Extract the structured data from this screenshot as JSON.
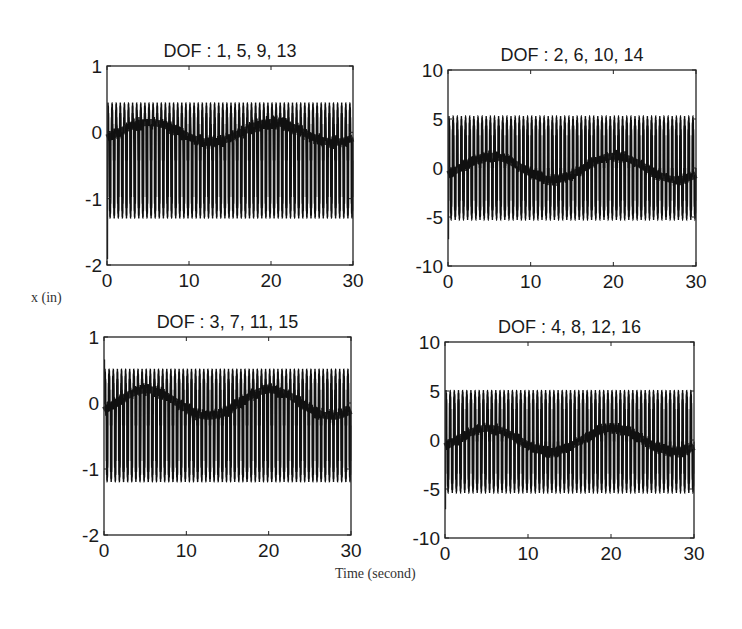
{
  "figure": {
    "ylabel": "x  (in)",
    "xlabel": "Time  (second)"
  },
  "chart_data": [
    {
      "type": "line",
      "title": "DOF : 1, 5,  9, 13",
      "xlabel": "Time (second)",
      "ylabel": "x (in)",
      "xlim": [
        0,
        30
      ],
      "ylim": [
        -2,
        1
      ],
      "xticks": [
        0,
        10,
        20,
        30
      ],
      "yticks": [
        -2,
        -1,
        0,
        1
      ],
      "grid": false,
      "signal": {
        "frequency_hz": 2.0,
        "upper_envelope": 0.45,
        "lower_envelope": -1.3,
        "mean_band": 0.0,
        "mean_band_amplitude": 0.15,
        "mean_band_period_s": 15,
        "initial_transient_min": -1.9
      }
    },
    {
      "type": "line",
      "title": "DOF : 2, 6, 10, 14",
      "xlabel": "Time (second)",
      "ylabel": "x (in)",
      "xlim": [
        0,
        30
      ],
      "ylim": [
        -10,
        10
      ],
      "xticks": [
        0,
        10,
        20,
        30
      ],
      "yticks": [
        -10,
        -5,
        0,
        5,
        10
      ],
      "grid": false,
      "signal": {
        "frequency_hz": 2.0,
        "upper_envelope": 5.3,
        "lower_envelope": -5.3,
        "mean_band": 0.0,
        "mean_band_amplitude": 1.2,
        "mean_band_period_s": 15,
        "initial_transient_min": -7.2
      }
    },
    {
      "type": "line",
      "title": "DOF : 3, 7, 11, 15",
      "xlabel": "Time (second)",
      "ylabel": "x (in)",
      "xlim": [
        0,
        30
      ],
      "ylim": [
        -2,
        1
      ],
      "xticks": [
        0,
        10,
        20,
        30
      ],
      "yticks": [
        -2,
        -1,
        0,
        1
      ],
      "grid": false,
      "signal": {
        "frequency_hz": 2.0,
        "upper_envelope": 0.52,
        "lower_envelope": -1.2,
        "mean_band": 0.0,
        "mean_band_amplitude": 0.2,
        "mean_band_period_s": 15,
        "initial_transient_max": 0.65
      }
    },
    {
      "type": "line",
      "title": "DOF : 4, 8, 12, 16",
      "xlabel": "Time (second)",
      "ylabel": "x (in)",
      "xlim": [
        0,
        30
      ],
      "ylim": [
        -10,
        10
      ],
      "xticks": [
        0,
        10,
        20,
        30
      ],
      "yticks": [
        -10,
        -5,
        0,
        5,
        10
      ],
      "grid": false,
      "signal": {
        "frequency_hz": 2.0,
        "upper_envelope": 5.1,
        "lower_envelope": -5.4,
        "mean_band": 0.0,
        "mean_band_amplitude": 1.2,
        "mean_band_period_s": 15,
        "initial_transient_min": -7.0
      }
    }
  ],
  "panels": [
    {
      "box": [
        107,
        66,
        353,
        265
      ]
    },
    {
      "box": [
        448,
        70,
        696,
        266
      ]
    },
    {
      "box": [
        104,
        337,
        351,
        535
      ]
    },
    {
      "box": [
        445,
        342,
        694,
        538
      ]
    }
  ],
  "colors": {
    "line": "#111111",
    "axes": "#222222",
    "background": "#ffffff"
  }
}
